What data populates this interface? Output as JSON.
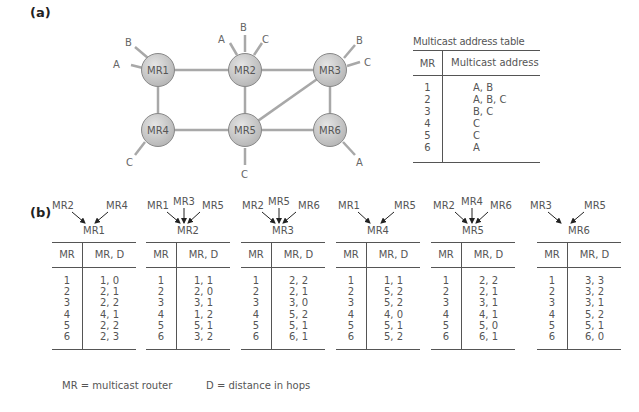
{
  "labels": {
    "part_a": "(a)",
    "part_b": "(b)"
  },
  "network": {
    "routers": [
      {
        "id": "MR1",
        "x": 158,
        "y": 70
      },
      {
        "id": "MR2",
        "x": 245,
        "y": 70
      },
      {
        "id": "MR3",
        "x": 330,
        "y": 70
      },
      {
        "id": "MR4",
        "x": 158,
        "y": 130
      },
      {
        "id": "MR5",
        "x": 245,
        "y": 130
      },
      {
        "id": "MR6",
        "x": 330,
        "y": 130
      }
    ],
    "links": [
      [
        "MR1",
        "MR2"
      ],
      [
        "MR2",
        "MR3"
      ],
      [
        "MR1",
        "MR4"
      ],
      [
        "MR2",
        "MR5"
      ],
      [
        "MR3",
        "MR6"
      ],
      [
        "MR4",
        "MR5"
      ],
      [
        "MR5",
        "MR6"
      ],
      [
        "MR5",
        "MR3"
      ]
    ],
    "hosts": [
      {
        "router": "MR1",
        "label": "B"
      },
      {
        "router": "MR1",
        "label": "A"
      },
      {
        "router": "MR2",
        "label": "A"
      },
      {
        "router": "MR2",
        "label": "B"
      },
      {
        "router": "MR2",
        "label": "C"
      },
      {
        "router": "MR3",
        "label": "B"
      },
      {
        "router": "MR3",
        "label": "C"
      },
      {
        "router": "MR4",
        "label": "C"
      },
      {
        "router": "MR5",
        "label": "C"
      },
      {
        "router": "MR6",
        "label": "A"
      }
    ]
  },
  "multicast_table": {
    "caption": "Multicast address table",
    "headers": [
      "MR",
      "Multicast address"
    ],
    "rows": [
      [
        "1",
        "A, B"
      ],
      [
        "2",
        "A, B, C"
      ],
      [
        "3",
        "B, C"
      ],
      [
        "4",
        "C"
      ],
      [
        "5",
        "C"
      ],
      [
        "6",
        "A"
      ]
    ]
  },
  "routing_tables": [
    {
      "name": "MR1",
      "inputs": [
        "MR2",
        "MR4"
      ],
      "headers": [
        "MR",
        "MR, D"
      ],
      "mr": [
        "1",
        "2",
        "3",
        "4",
        "5",
        "6"
      ],
      "vals": [
        "1, 0",
        "2, 1",
        "2, 2",
        "4, 1",
        "2, 2",
        "2, 3"
      ]
    },
    {
      "name": "MR2",
      "inputs": [
        "MR1",
        "MR3",
        "MR5"
      ],
      "headers": [
        "MR",
        "MR, D"
      ],
      "mr": [
        "1",
        "2",
        "3",
        "4",
        "5",
        "6"
      ],
      "vals": [
        "1, 1",
        "2, 0",
        "3, 1",
        "1, 2",
        "5, 1",
        "3, 2"
      ]
    },
    {
      "name": "MR3",
      "inputs": [
        "MR2",
        "MR5",
        "MR6"
      ],
      "headers": [
        "MR",
        "MR, D"
      ],
      "mr": [
        "1",
        "2",
        "3",
        "4",
        "5",
        "6"
      ],
      "vals": [
        "2, 2",
        "2, 1",
        "3, 0",
        "5, 2",
        "5, 1",
        "6, 1"
      ]
    },
    {
      "name": "MR4",
      "inputs": [
        "MR1",
        "MR5"
      ],
      "headers": [
        "MR",
        "MR, D"
      ],
      "mr": [
        "1",
        "2",
        "3",
        "4",
        "5",
        "6"
      ],
      "vals": [
        "1, 1",
        "5, 2",
        "5, 2",
        "4, 0",
        "5, 1",
        "5, 2"
      ]
    },
    {
      "name": "MR5",
      "inputs": [
        "MR2",
        "MR4",
        "MR6"
      ],
      "headers": [
        "MR",
        "MR, D"
      ],
      "mr": [
        "1",
        "2",
        "3",
        "4",
        "5",
        "6"
      ],
      "vals": [
        "2, 2",
        "2, 1",
        "3, 1",
        "4, 1",
        "5, 0",
        "6, 1"
      ]
    },
    {
      "name": "MR6",
      "inputs": [
        "MR3",
        "MR5"
      ],
      "headers": [
        "MR",
        "MR, D"
      ],
      "mr": [
        "1",
        "2",
        "3",
        "4",
        "5",
        "6"
      ],
      "vals": [
        "3, 3",
        "3, 2",
        "3, 1",
        "5, 2",
        "5, 1",
        "6, 0"
      ]
    }
  ],
  "legend": {
    "mr": "MR = multicast router",
    "d": "D = distance in hops"
  }
}
